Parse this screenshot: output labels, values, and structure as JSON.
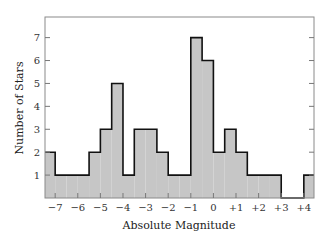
{
  "chart_data": {
    "type": "bar",
    "subtype": "histogram",
    "title": "",
    "xlabel": "Absolute Magnitude",
    "ylabel": "Number of Stars",
    "xlim": [
      -7.45,
      4.45
    ],
    "ylim": [
      0,
      7.9
    ],
    "grid": false,
    "legend": null,
    "bin_width": 0.5,
    "x_ticks": [
      -7,
      -6,
      -5,
      -4,
      -3,
      -2,
      -1,
      0,
      1,
      2,
      3,
      4
    ],
    "x_tick_labels": [
      "−7",
      "−6",
      "−5",
      "−4",
      "−3",
      "−2",
      "−1",
      "0",
      "+1",
      "+2",
      "+3",
      "+4"
    ],
    "y_ticks": [
      1,
      2,
      3,
      4,
      5,
      6,
      7
    ],
    "y_tick_labels": [
      "1",
      "2",
      "3",
      "4",
      "5",
      "6",
      "7"
    ],
    "bins": [
      {
        "start": -7.5,
        "end": -7.0,
        "count": 2
      },
      {
        "start": -7.0,
        "end": -6.5,
        "count": 1
      },
      {
        "start": -6.5,
        "end": -6.0,
        "count": 1
      },
      {
        "start": -6.0,
        "end": -5.5,
        "count": 1
      },
      {
        "start": -5.5,
        "end": -5.0,
        "count": 2
      },
      {
        "start": -5.0,
        "end": -4.5,
        "count": 3
      },
      {
        "start": -4.5,
        "end": -4.0,
        "count": 5
      },
      {
        "start": -4.0,
        "end": -3.5,
        "count": 1
      },
      {
        "start": -3.5,
        "end": -3.0,
        "count": 3
      },
      {
        "start": -3.0,
        "end": -2.5,
        "count": 3
      },
      {
        "start": -2.5,
        "end": -2.0,
        "count": 2
      },
      {
        "start": -2.0,
        "end": -1.5,
        "count": 1
      },
      {
        "start": -1.5,
        "end": -1.0,
        "count": 1
      },
      {
        "start": -1.0,
        "end": -0.5,
        "count": 7
      },
      {
        "start": -0.5,
        "end": 0.0,
        "count": 6
      },
      {
        "start": 0.0,
        "end": 0.5,
        "count": 2
      },
      {
        "start": 0.5,
        "end": 1.0,
        "count": 3
      },
      {
        "start": 1.0,
        "end": 1.5,
        "count": 2
      },
      {
        "start": 1.5,
        "end": 2.0,
        "count": 1
      },
      {
        "start": 2.0,
        "end": 2.5,
        "count": 1
      },
      {
        "start": 2.5,
        "end": 3.0,
        "count": 1
      },
      {
        "start": 3.0,
        "end": 3.5,
        "count": 0
      },
      {
        "start": 3.5,
        "end": 4.0,
        "count": 0
      },
      {
        "start": 4.0,
        "end": 4.5,
        "count": 1
      }
    ],
    "colors": {
      "fill": "#c6c6c6",
      "outline": "#111111",
      "frame": "#8a8a8a",
      "tick": "#777777"
    }
  }
}
